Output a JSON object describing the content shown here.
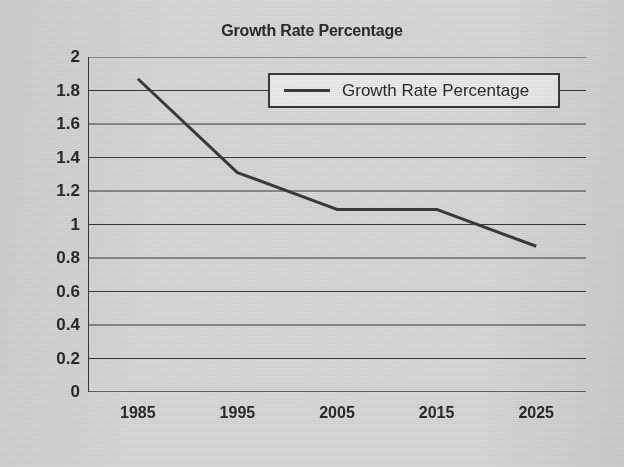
{
  "chart_data": {
    "type": "line",
    "title": "Growth Rate Percentage",
    "xlabel": "",
    "ylabel": "",
    "x": [
      1985,
      1995,
      2005,
      2015,
      2025
    ],
    "categories": [
      "1985",
      "1995",
      "2005",
      "2015",
      "2025"
    ],
    "series": [
      {
        "name": "Growth Rate Percentage",
        "values": [
          1.87,
          1.31,
          1.09,
          1.09,
          0.87
        ],
        "color": "#3a3a3a"
      }
    ],
    "ylim": [
      0,
      2
    ],
    "ytick_step": 0.2,
    "ytick_labels": [
      "2",
      "1.8",
      "1.6",
      "1.4",
      "1.2",
      "1",
      "0.8",
      "0.6",
      "0.4",
      "0.2",
      "0"
    ],
    "ytick_values": [
      2,
      1.8,
      1.6,
      1.4,
      1.2,
      1,
      0.8,
      0.6,
      0.4,
      0.2,
      0
    ],
    "grid": true,
    "grid_axis": "y",
    "legend_position": "top-center",
    "legend_entries": [
      "Growth Rate Percentage"
    ],
    "background_color": "#d9d9d9",
    "axis_color": "#3a3a3a"
  }
}
